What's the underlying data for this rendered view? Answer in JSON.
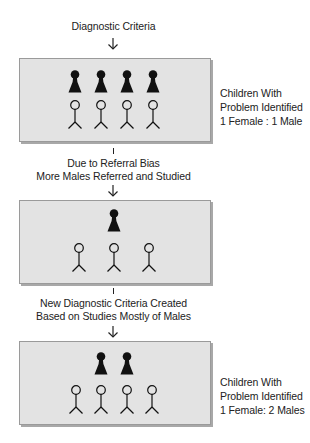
{
  "diagram": {
    "steps": [
      {
        "caption_above": [
          "Diagnostic Criteria"
        ],
        "box": {
          "females": 4,
          "males": 4,
          "side_label": [
            "Children With",
            "Problem Identified",
            "1 Female : 1 Male"
          ]
        }
      },
      {
        "caption_above": [
          "Due to Referral Bias",
          "More Males Referred and Studied"
        ],
        "box": {
          "females": 1,
          "males": 3,
          "side_label": []
        }
      },
      {
        "caption_above": [
          "New Diagnostic Criteria Created",
          "Based on Studies Mostly of Males"
        ],
        "box": {
          "females": 2,
          "males": 4,
          "side_label": [
            "Children With",
            "Problem Identified",
            "1 Female: 2 Males"
          ]
        }
      }
    ],
    "legend": {
      "female_icon": "solid-black-pawn-figure",
      "male_icon": "stick-figure-outline"
    },
    "colors": {
      "box_fill": "#e3e3e3",
      "box_border": "#9a9a9a",
      "box_shadow": "#a8a8a8",
      "figure": "#111111"
    }
  }
}
